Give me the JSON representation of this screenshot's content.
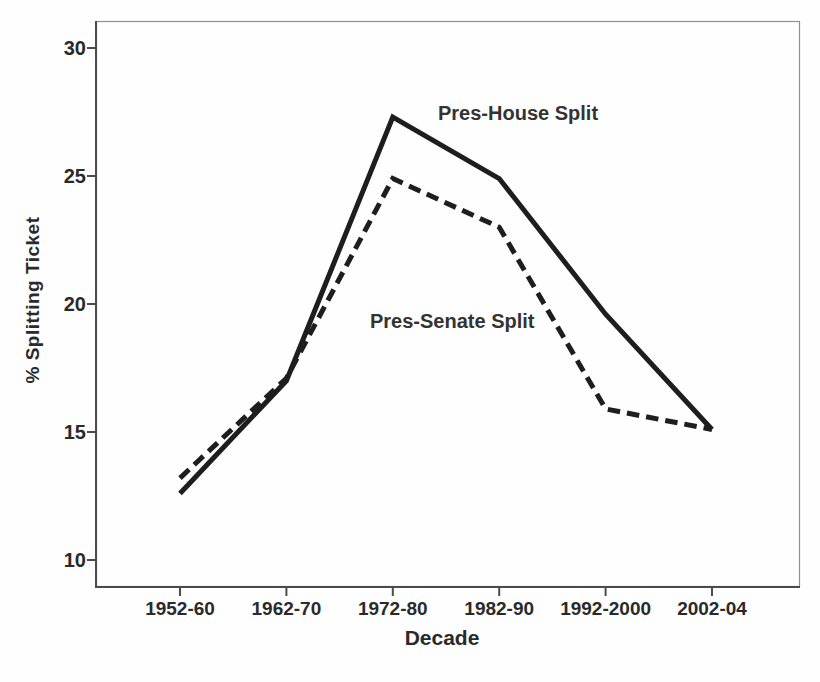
{
  "figure": {
    "background": "#fefefe",
    "line_color": "#1e1e1e",
    "axis_color": "#4b4b4b",
    "frame_color": "#919191",
    "text_color": "#2a2a2a"
  },
  "chart_data": {
    "type": "line",
    "title": "",
    "xlabel": "Decade",
    "ylabel": "% Splitting Ticket",
    "categories": [
      "1952-60",
      "1962-70",
      "1972-80",
      "1982-90",
      "1992-2000",
      "2002-04"
    ],
    "yticks": [
      10,
      15,
      20,
      25,
      30
    ],
    "ylim": [
      8.9,
      31.1
    ],
    "grid": false,
    "legend_position": "inline-annotations",
    "series": [
      {
        "name": "Pres-House Split",
        "line_style": "solid",
        "color": "#1e1e1e",
        "values": [
          12.6,
          17.0,
          27.3,
          24.9,
          19.6,
          15.1
        ]
      },
      {
        "name": "Pres-Senate Split",
        "line_style": "dashed",
        "color": "#1e1e1e",
        "values": [
          13.2,
          17.1,
          24.9,
          23.0,
          15.9,
          15.1
        ]
      }
    ],
    "annotations": [
      {
        "text": "Pres-House Split"
      },
      {
        "text": "Pres-Senate Split"
      }
    ]
  }
}
